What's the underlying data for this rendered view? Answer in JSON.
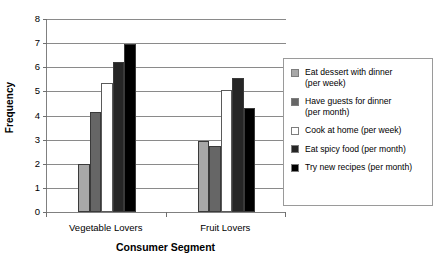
{
  "chart_data": {
    "type": "bar",
    "title": "",
    "xlabel": "Consumer Segment",
    "ylabel": "Frequency",
    "categories": [
      "Vegetable Lovers",
      "Fruit Lovers"
    ],
    "ylim": [
      0,
      8
    ],
    "yticks": [
      0,
      1,
      2,
      3,
      4,
      5,
      6,
      7,
      8
    ],
    "ytick_labels": [
      "0",
      "1",
      "2",
      "3",
      "4",
      "5",
      "6",
      "7",
      "8"
    ],
    "grid": true,
    "legend_position": "right",
    "series": [
      {
        "name": "Eat dessert with dinner (per week)",
        "name_line1": "Eat dessert with dinner",
        "name_line2": "(per week)",
        "color": "#a8a8a8",
        "values": [
          2.0,
          2.95
        ]
      },
      {
        "name": "Have guests for dinner (per month)",
        "name_line1": "Have guests for dinner",
        "name_line2": "(per month)",
        "color": "#666666",
        "values": [
          4.15,
          2.75
        ]
      },
      {
        "name": "Cook at home (per week)",
        "name_line1": "Cook at home (per week)",
        "name_line2": "",
        "color": "#ffffff",
        "values": [
          5.35,
          5.05
        ]
      },
      {
        "name": "Eat spicy food (per month)",
        "name_line1": "Eat spicy food (per month)",
        "name_line2": "",
        "color": "#262626",
        "values": [
          6.2,
          5.55
        ]
      },
      {
        "name": "Try new recipes (per month)",
        "name_line1": "Try new recipes (per month)",
        "name_line2": "",
        "color": "#000000",
        "values": [
          6.95,
          4.3
        ]
      }
    ]
  },
  "axes": {
    "y_title": "Frequency",
    "x_title": "Consumer Segment"
  },
  "colors": {
    "gridline": "#8a8a8a",
    "axis": "#808080",
    "legend_border": "#9a9a9a",
    "text": "#000000",
    "background": "#ffffff"
  }
}
